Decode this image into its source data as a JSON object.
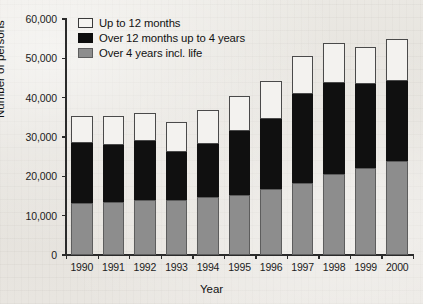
{
  "chart_data": {
    "type": "bar",
    "stacked": true,
    "title": "",
    "subtitle": "",
    "xlabel": "Year",
    "ylabel": "Number of persons",
    "categories": [
      "1990",
      "1991",
      "1992",
      "1993",
      "1994",
      "1995",
      "1996",
      "1997",
      "1998",
      "1999",
      "2000"
    ],
    "series": [
      {
        "name": "Over 4 years incl. life",
        "color": "#8d8d8d",
        "values": [
          13200,
          13600,
          14000,
          13900,
          14800,
          15200,
          16700,
          18200,
          20500,
          22000,
          23800
        ]
      },
      {
        "name": "Over 12 months up to 4 years",
        "color": "#101010",
        "values": [
          15200,
          14400,
          14900,
          12200,
          13500,
          16300,
          18000,
          22700,
          23200,
          21500,
          20400
        ]
      },
      {
        "name": "Up to 12 months",
        "color": "#f3f2ef",
        "values": [
          7000,
          7400,
          7300,
          7600,
          8500,
          9000,
          9500,
          9600,
          10200,
          9400,
          10700
        ]
      }
    ],
    "cumulative_tops": {
      "1990": [
        13200,
        28400,
        35400
      ],
      "1991": [
        13600,
        28000,
        35400
      ],
      "1992": [
        14000,
        28900,
        36200
      ],
      "1993": [
        13900,
        26100,
        33700
      ],
      "1994": [
        14800,
        28300,
        36800
      ],
      "1995": [
        15200,
        31500,
        40500
      ],
      "1996": [
        16700,
        34700,
        44200
      ],
      "1997": [
        18200,
        40900,
        50500
      ],
      "1998": [
        20500,
        43700,
        53900
      ],
      "1999": [
        22000,
        43500,
        52900
      ],
      "2000": [
        23800,
        44200,
        54900
      ]
    },
    "totals": [
      35400,
      35400,
      36200,
      33700,
      36800,
      40500,
      44200,
      50500,
      53900,
      52900,
      54900
    ],
    "ylim": [
      0,
      60000
    ],
    "ytick_values": [
      0,
      10000,
      20000,
      30000,
      40000,
      50000,
      60000
    ],
    "ytick_labels": [
      "0",
      "10,000",
      "20,000",
      "30,000",
      "40,000",
      "50,000",
      "60,000"
    ],
    "grid": false,
    "legend_position": "top-left",
    "legend": [
      {
        "label": "Up to 12 months",
        "swatch": "white"
      },
      {
        "label": "Over 12 months up to 4 years",
        "swatch": "black"
      },
      {
        "label": "Over 4 years incl. life",
        "swatch": "gray"
      }
    ]
  }
}
